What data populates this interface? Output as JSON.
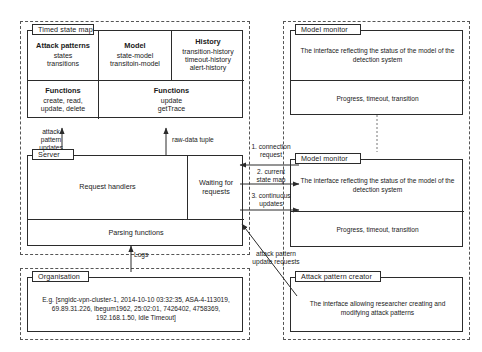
{
  "diagram": {
    "left_package": {
      "timed_state_map": {
        "tab": "Timed state map",
        "columns": [
          {
            "title": "Attack patterns",
            "lines": "states\ntransitions"
          },
          {
            "title": "Model",
            "lines": "state-model\ntransitoin-model"
          },
          {
            "title": "History",
            "lines": "transition-history\ntimeout-history\nalert-history"
          }
        ],
        "function_cells": [
          {
            "title": "Functions",
            "lines": "create, read,\nupdate, delete"
          },
          {
            "title": "Functions",
            "lines": "update\ngetTrace"
          }
        ]
      },
      "server": {
        "tab": "Server",
        "request_handlers": "Request handlers",
        "waiting_for_requests": "Waiting for\nrequests",
        "parsing_functions": "Parsing functions"
      }
    },
    "organisation": {
      "tab": "Organisation",
      "example": "E.g. [sngidc-vpn-cluster-1, 2014-10-10 03:32:35, ASA-4-113019,\n69.89.31.226, lbegum1962, 25:02:01, 7426402, 4758369,\n192.168.1.50, Idle Timeout]"
    },
    "right_package": {
      "model_monitor_top": {
        "tab": "Model monitor",
        "description": "The interface reflecting the status of the model of the\ndetection system",
        "footer": "Progress, timeout, transition"
      },
      "model_monitor_mid": {
        "tab": "Model monitor",
        "description": "The interface reflecting the status of the model of the\ndetection system",
        "footer": "Progress, timeout, transition"
      },
      "attack_pattern_creator": {
        "tab": "Attack pattern creator",
        "description": "The interface allowing researcher creating and\nmodifying attack patterns"
      }
    },
    "connectors": [
      {
        "id": "attack-pattern-updates",
        "label": "attack\npattern\nupdates"
      },
      {
        "id": "raw-data-tuple",
        "label": "raw-data tuple"
      },
      {
        "id": "logs",
        "label": "Logs"
      },
      {
        "id": "connection-request",
        "label": "1. connection\nrequest"
      },
      {
        "id": "current-state-map",
        "label": "2. current\nstate map"
      },
      {
        "id": "continuous-updates",
        "label": "3. continuous\nupdates"
      },
      {
        "id": "attack-pattern-update-requests",
        "label": "attack pattern\nupdate requests"
      }
    ]
  }
}
